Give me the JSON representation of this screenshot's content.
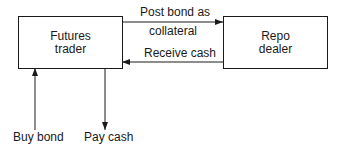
{
  "nodes": {
    "futures_trader": {
      "line1": "Futures",
      "line2": "trader"
    },
    "repo_dealer": {
      "line1": "Repo",
      "line2": "dealer"
    }
  },
  "edges": {
    "post_bond": {
      "line1": "Post bond as",
      "line2": "collateral",
      "from": "Futures trader",
      "to": "Repo dealer"
    },
    "receive_cash": {
      "label": "Receive cash",
      "from": "Repo dealer",
      "to": "Futures trader"
    },
    "buy_bond": {
      "label": "Buy bond",
      "to": "Futures trader"
    },
    "pay_cash": {
      "label": "Pay cash",
      "from": "Futures trader"
    }
  },
  "colors": {
    "line": "#1a1a1a",
    "background": "#ffffff"
  }
}
